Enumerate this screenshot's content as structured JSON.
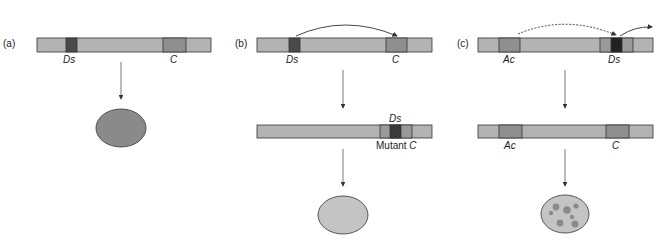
{
  "colors": {
    "chromosome": "#b3b3b3",
    "gene_c": "#8f8f8f",
    "ds_element": "#4a4a4a",
    "ds_element_dark": "#222222",
    "ac_element": "#8f8f8f",
    "outline": "#333333",
    "kernel_purple": "#8a8a8a",
    "kernel_colorless": "#c4c4c4",
    "spot": "#8a8a8a"
  },
  "panels": [
    {
      "id": "a",
      "label": "(a)",
      "top_chromosome": {
        "labels": {
          "ds": "Ds",
          "c": "C"
        }
      },
      "outcome": "Pigmented kernel"
    },
    {
      "id": "b",
      "label": "(b)",
      "top_chromosome": {
        "labels": {
          "ds": "Ds",
          "c": "C"
        }
      },
      "bottom_chromosome": {
        "labels": {
          "ds": "Ds",
          "mutant_prefix": "Mutant ",
          "c": "C"
        }
      },
      "outcome": "Colorless kernel"
    },
    {
      "id": "c",
      "label": "(c)",
      "top_chromosome": {
        "labels": {
          "ac": "Ac",
          "ds": "Ds"
        }
      },
      "bottom_chromosome": {
        "labels": {
          "ac": "Ac",
          "c": "C"
        }
      },
      "outcome": "Spotted kernel"
    }
  ]
}
